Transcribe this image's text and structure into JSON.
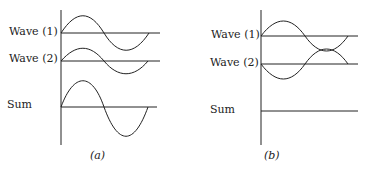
{
  "panels": [
    {
      "caption": "(a)",
      "labels": {
        "wave1": "Wave (1)",
        "wave2": "Wave (2)",
        "sum": "Sum"
      },
      "description": "Constructive interference: waves in phase, sum has double amplitude"
    },
    {
      "caption": "(b)",
      "labels": {
        "wave1": "Wave (1)",
        "wave2": "Wave (2)",
        "sum": "Sum"
      },
      "description": "Destructive interference: waves out of phase, sum is zero"
    }
  ],
  "colors": {
    "stroke": "#222222",
    "background": "#ffffff"
  }
}
